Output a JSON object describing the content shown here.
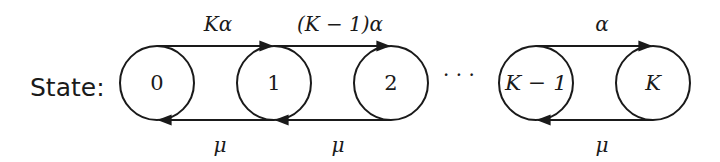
{
  "diagram": {
    "type": "birth-death-chain",
    "row_label": "State:",
    "nodes": [
      {
        "id": "0",
        "label": "0",
        "cx": 157
      },
      {
        "id": "1",
        "label": "1",
        "cx": 274
      },
      {
        "id": "2",
        "label": "2",
        "cx": 391
      },
      {
        "id": "K-1",
        "label": "K − 1",
        "cx": 536
      },
      {
        "id": "K",
        "label": "K",
        "cx": 653
      }
    ],
    "ellipsis": "· · ·",
    "forward_edges": [
      {
        "from": "0",
        "to": "1",
        "label": "Kα"
      },
      {
        "from": "1",
        "to": "2",
        "label": "(K − 1)α"
      },
      {
        "from": "K-1",
        "to": "K",
        "label": "α"
      }
    ],
    "backward_edges": [
      {
        "from": "1",
        "to": "0",
        "label": "μ"
      },
      {
        "from": "2",
        "to": "1",
        "label": "μ"
      },
      {
        "from": "K",
        "to": "K-1",
        "label": "μ"
      }
    ],
    "colors": {
      "stroke": "#1a1a1a",
      "background": "#ffffff"
    }
  }
}
